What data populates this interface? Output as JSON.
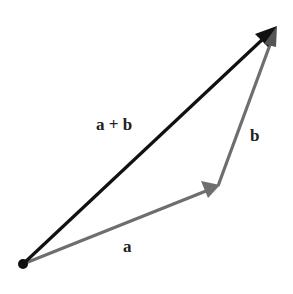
{
  "diagram": {
    "origin": {
      "x": 23,
      "y": 264
    },
    "vectors": [
      {
        "id": "a",
        "label": "a",
        "from": [
          23,
          264
        ],
        "to": [
          218,
          186
        ],
        "color": "#6e6e6e"
      },
      {
        "id": "b",
        "label": "b",
        "from": [
          218,
          186
        ],
        "to": [
          276,
          27
        ],
        "color": "#6e6e6e"
      },
      {
        "id": "a_plus_b",
        "label": "a + b",
        "from": [
          23,
          264
        ],
        "to": [
          276,
          27
        ],
        "color": "#111111"
      }
    ],
    "labels": {
      "sum": "a + b",
      "b": "b",
      "a": "a"
    }
  }
}
